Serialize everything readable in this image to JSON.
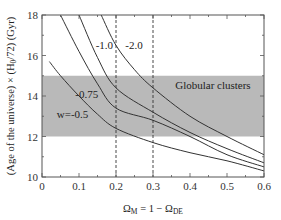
{
  "chart_data": {
    "type": "line",
    "title": "",
    "xlabel": "Ω_M = 1 − Ω_DE",
    "ylabel": "(Age of the universe) × (H0/72) (Gyr)",
    "xlim": [
      0,
      0.6
    ],
    "ylim": [
      10,
      18
    ],
    "x_ticks": [
      0,
      0.1,
      0.2,
      0.3,
      0.4,
      0.5,
      0.6
    ],
    "x_tick_labels": [
      "0",
      "0.1",
      "0.2",
      "0.3",
      "0.4",
      "0.5",
      "0.6"
    ],
    "y_ticks": [
      10,
      12,
      14,
      16,
      18
    ],
    "y_tick_labels": [
      "10",
      "12",
      "14",
      "16",
      "18"
    ],
    "grid": false,
    "series": [
      {
        "name": "w=-0.5",
        "label": "w=-0.5",
        "x": [
          0.02,
          0.05,
          0.1,
          0.15,
          0.2,
          0.3,
          0.4,
          0.5,
          0.6
        ],
        "y": [
          15.7,
          15.0,
          14.0,
          13.1,
          12.4,
          11.7,
          11.2,
          10.8,
          10.3
        ]
      },
      {
        "name": "w=-0.75",
        "label": "-0.75",
        "x": [
          0.05,
          0.1,
          0.15,
          0.2,
          0.3,
          0.4,
          0.5,
          0.6
        ],
        "y": [
          18.0,
          16.2,
          14.6,
          13.4,
          12.8,
          12.0,
          11.1,
          10.5
        ]
      },
      {
        "name": "w=-1.0",
        "label": "-1.0",
        "x": [
          0.1,
          0.15,
          0.2,
          0.3,
          0.4,
          0.5,
          0.6
        ],
        "y": [
          18.0,
          15.9,
          14.4,
          13.2,
          12.2,
          11.4,
          10.7
        ]
      },
      {
        "name": "w=-2.0",
        "label": "-2.0",
        "x": [
          0.16,
          0.2,
          0.25,
          0.3,
          0.4,
          0.5,
          0.6
        ],
        "y": [
          18.0,
          16.5,
          15.3,
          14.4,
          13.0,
          12.0,
          11.1
        ]
      }
    ],
    "bands": [
      {
        "name": "Globular clusters",
        "label": "Globular clusters",
        "y_from": 12,
        "y_to": 15,
        "color": "#b9b9b9"
      }
    ],
    "vlines": [
      {
        "x": 0.2,
        "style": "dashed"
      },
      {
        "x": 0.3,
        "style": "dashed"
      }
    ],
    "annotations": [
      {
        "text": "w=-0.5",
        "x": 0.04,
        "y": 12.9
      },
      {
        "text": "-0.75",
        "x": 0.09,
        "y": 13.9
      },
      {
        "text": "-1.0",
        "x": 0.145,
        "y": 16.3
      },
      {
        "text": "-2.0",
        "x": 0.225,
        "y": 16.3
      },
      {
        "text": "Globular clusters",
        "x": 0.36,
        "y": 14.35
      }
    ]
  },
  "axes": {
    "x_title_main": "Ω",
    "x_title_sub1": "M",
    "x_title_mid": " = 1 − Ω",
    "x_title_sub2": "DE",
    "y_title_part1": "(Age of the universe) × (H",
    "y_title_sub": "0",
    "y_title_part2": "/72) (Gyr)"
  },
  "colors": {
    "band": "#b9b9b9",
    "curve": "#333333",
    "axis": "#555555"
  }
}
